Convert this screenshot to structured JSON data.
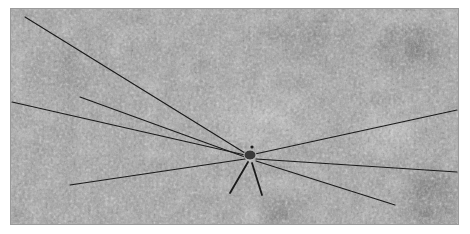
{
  "image": {
    "description": "Grayscale photograph of a harvestman (daddy-longlegs) with very long thin legs spread across a speckled stone surface",
    "subject": "harvestman",
    "background": "speckled grey stone texture",
    "colors": {
      "border": "#9a9a9a",
      "stone_mid": "#9c9c9c",
      "legs": "#1a1a1a",
      "page": "#ffffff"
    }
  },
  "spider": {
    "body_center": [
      250,
      155
    ],
    "legs": [
      {
        "from": [
          245,
          153
        ],
        "to": [
          25,
          17
        ]
      },
      {
        "from": [
          245,
          155
        ],
        "to": [
          12,
          102
        ]
      },
      {
        "from": [
          245,
          157
        ],
        "to": [
          80,
          97
        ]
      },
      {
        "from": [
          245,
          159
        ],
        "to": [
          70,
          185
        ]
      },
      {
        "from": [
          255,
          154
        ],
        "to": [
          457,
          110
        ]
      },
      {
        "from": [
          256,
          159
        ],
        "to": [
          457,
          172
        ]
      },
      {
        "from": [
          256,
          161
        ],
        "to": [
          395,
          205
        ]
      },
      {
        "from": [
          248,
          162
        ],
        "to": [
          230,
          193
        ]
      },
      {
        "from": [
          252,
          163
        ],
        "to": [
          262,
          195
        ]
      }
    ]
  }
}
